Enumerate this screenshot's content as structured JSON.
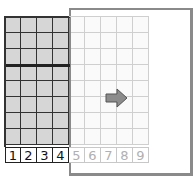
{
  "diagram": {
    "columns": 9,
    "rows": 8,
    "shaded_columns": 4,
    "thick_row_after": 3,
    "column_labels": [
      "1",
      "2",
      "3",
      "4",
      "5",
      "6",
      "7",
      "8",
      "9"
    ],
    "arrow_icon": "right-arrow",
    "colors": {
      "shaded_fill": "#d6d6d6",
      "grid_line_dark": "#333333",
      "grid_line_light": "#cfcfcf",
      "panel_border": "#8a8a8a",
      "arrow_fill": "#8c8c8c",
      "label_dark": "#111111",
      "label_light": "#b0b0b0"
    }
  }
}
